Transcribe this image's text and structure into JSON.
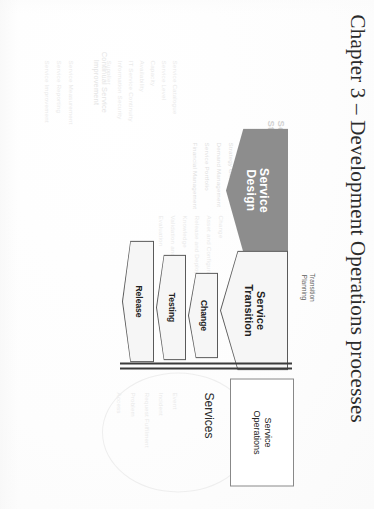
{
  "page": {
    "title": "Chapter 3 – Development Operations processes",
    "background_color": "#fefefe",
    "rotation_degrees": 90
  },
  "diagram": {
    "name": "ITIL service lifecycle development operations diagram",
    "accent_dark": "#8d8d8d",
    "accent_light": "#f4f4f4",
    "outline_color": "#5a5a5a",
    "stages": [
      {
        "id": "service-design",
        "label": "Service\nDesign",
        "label_line1": "Service",
        "label_line2": "Design",
        "shape": "chevron",
        "fill": "#8d8d8d",
        "text_color": "#ffffff"
      },
      {
        "id": "service-transition",
        "label_line1": "Service",
        "label_line2": "Transition",
        "shape": "chevron",
        "fill": "#f4f4f4",
        "text_color": "#222222"
      },
      {
        "id": "change",
        "label": "Change",
        "shape": "chevron",
        "fill": "#f4f4f4",
        "text_color": "#222222"
      },
      {
        "id": "testing",
        "label": "Testing",
        "shape": "chevron",
        "fill": "#f4f4f4",
        "text_color": "#222222"
      },
      {
        "id": "release",
        "label": "Release",
        "shape": "chevron",
        "fill": "#f4f4f4",
        "text_color": "#222222"
      }
    ],
    "transition_planning_label_line1": "Transition",
    "transition_planning_label_line2": "Planning",
    "service_operations_box": {
      "label_line1": "Service",
      "label_line2": "Operations"
    },
    "services_label": "Services"
  },
  "ghost_text": {
    "continual_header_line1": "Continual Service",
    "continual_header_line2": "Improvement",
    "strategy_header_line1": "Service",
    "strategy_header_line2": "Strategy",
    "strategy_column": [
      "Strategy\nGeneration",
      "Demand\nManagement",
      "Service\nPortfolio\nManagement",
      "Financial\nManagement"
    ],
    "strategy_items": [
      "Strategy Generation",
      "Demand Management",
      "Service Portfolio",
      "Financial Management"
    ],
    "design_items": [
      "Service Catalogue",
      "Service Level",
      "Capacity",
      "Availability",
      "IT Service Continuity",
      "Information Security",
      "Supplier"
    ],
    "transition_items": [
      "Change",
      "Asset and Configuration",
      "Release and Deployment",
      "Knowledge",
      "Validation and Testing",
      "Evaluation"
    ],
    "operation_items": [
      "Event",
      "Incident",
      "Request Fulfilment",
      "Problem",
      "Access"
    ],
    "csi_items": [
      "Service Measurement",
      "Service Reporting",
      "Service Improvement"
    ]
  }
}
